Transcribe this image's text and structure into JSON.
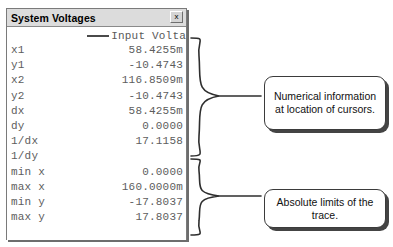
{
  "panel": {
    "title": "System Voltages",
    "close_label": "x",
    "close_icon": "close-icon",
    "legend": {
      "label": "Input Volta",
      "line_color": "#4a4a4a"
    },
    "rows": [
      {
        "label": "x1",
        "value": "58.4255m"
      },
      {
        "label": "y1",
        "value": "-10.4743"
      },
      {
        "label": "x2",
        "value": "116.8509m"
      },
      {
        "label": "y2",
        "value": "-10.4743"
      },
      {
        "label": "dx",
        "value": "58.4255m"
      },
      {
        "label": "dy",
        "value": "0.0000"
      },
      {
        "label": "1/dx",
        "value": "17.1158"
      },
      {
        "label": "1/dy",
        "value": ""
      },
      {
        "label": "min x",
        "value": "0.0000"
      },
      {
        "label": "max x",
        "value": "160.0000m"
      },
      {
        "label": "min y",
        "value": "-17.8037"
      },
      {
        "label": "max y",
        "value": "17.8037"
      }
    ]
  },
  "annotations": {
    "cursors": "Numerical information at location of cursors.",
    "limits": "Absolute limits of the trace."
  },
  "colors": {
    "titlebar": "#dcdcdc",
    "text": "#5d5d5d",
    "border": "#7a7a7a",
    "callout_border": "#3b3b3b",
    "shadow": "#444444"
  }
}
